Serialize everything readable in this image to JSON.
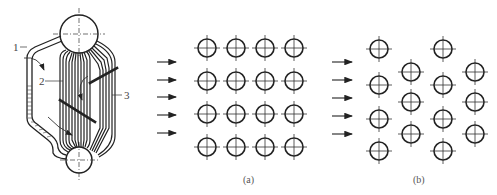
{
  "figure": {
    "boiler": {
      "labels": [
        {
          "id": "1",
          "text": "1"
        },
        {
          "id": "2",
          "text": "2"
        },
        {
          "id": "3",
          "text": "3"
        }
      ]
    },
    "panel_a": {
      "caption": "(a)",
      "arrangement": "in-line",
      "rows": 4,
      "cols": 4,
      "flow_arrows": 5
    },
    "panel_b": {
      "caption": "(b)",
      "arrangement": "staggered",
      "flow_arrows": 5
    }
  },
  "colors": {
    "ink": "#222222",
    "background": "#ffffff"
  }
}
